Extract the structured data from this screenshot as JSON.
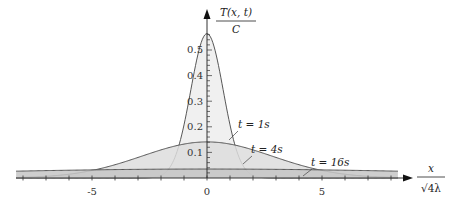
{
  "chart_data": {
    "type": "area",
    "title": "",
    "xlabel": "x / √(4λ)",
    "ylabel": "T(x,t) / C",
    "xlim": [
      -8.3,
      8.9
    ],
    "ylim": [
      0,
      0.62
    ],
    "x_ticks": [
      -8,
      -7,
      -6,
      -5,
      -4,
      -3,
      -2,
      -1,
      0,
      1,
      2,
      3,
      4,
      5,
      6,
      7,
      8
    ],
    "x_tick_labels": [
      {
        "value": -5,
        "label": "-5"
      },
      {
        "value": 0,
        "label": "0"
      },
      {
        "value": 5,
        "label": "5"
      }
    ],
    "y_tick_labels": [
      {
        "value": 0.1,
        "label": "0.1"
      },
      {
        "value": 0.2,
        "label": "0.2"
      },
      {
        "value": 0.3,
        "label": "0.3"
      },
      {
        "value": 0.4,
        "label": "0.4"
      },
      {
        "value": 0.5,
        "label": "0.5"
      }
    ],
    "y_minor_tick_step": 0.02,
    "grid": false,
    "legend": "none (inline annotations)",
    "series": [
      {
        "name": "t = 1s",
        "t": 1,
        "peak": 0.564,
        "fill": "#ededed",
        "x": [
          -3,
          -2,
          -1.5,
          -1,
          -0.5,
          0,
          0.5,
          1,
          1.5,
          2,
          3
        ],
        "values": [
          0.0001,
          0.01,
          0.059,
          0.208,
          0.439,
          0.564,
          0.439,
          0.208,
          0.059,
          0.01,
          0.0001
        ]
      },
      {
        "name": "t = 4s",
        "t": 4,
        "peak": 0.141,
        "fill": "#dddddd",
        "x": [
          -8,
          -6,
          -4,
          -3,
          -2,
          -1,
          0,
          1,
          2,
          3,
          4,
          6,
          8
        ],
        "values": [
          0.003,
          0.015,
          0.052,
          0.081,
          0.11,
          0.132,
          0.141,
          0.132,
          0.11,
          0.081,
          0.052,
          0.015,
          0.003
        ]
      },
      {
        "name": "t = 16s",
        "t": 16,
        "peak": 0.035,
        "fill": "#c6c6c6",
        "x": [
          -8,
          -6,
          -4,
          -2,
          0,
          2,
          4,
          6,
          8
        ],
        "values": [
          0.027,
          0.03,
          0.033,
          0.035,
          0.035,
          0.035,
          0.033,
          0.03,
          0.027
        ]
      }
    ],
    "annotations": [
      {
        "text": "t = 1s",
        "points_to": {
          "x": 1.6,
          "y": 0.05
        }
      },
      {
        "text": "t = 4s",
        "points_to": {
          "x": 3.6,
          "y": 0.06
        }
      },
      {
        "text": "t = 16s",
        "points_to": {
          "x": 4.6,
          "y": 0.03
        }
      }
    ]
  },
  "labels": {
    "y_axis_num": "T(x, t)",
    "y_axis_den": "C",
    "x_axis_num": "x",
    "x_axis_den": "√4λ",
    "t1": "t = 1s",
    "t4": "t = 4s",
    "t16": "t = 16s",
    "xm5": "-5",
    "x0": "0",
    "x5": "5",
    "y01": "0.1",
    "y02": "0.2",
    "y03": "0.3",
    "y04": "0.4",
    "y05": "0.5"
  }
}
